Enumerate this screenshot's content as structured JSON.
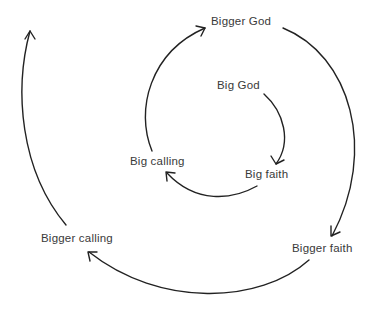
{
  "diagram": {
    "type": "spiral-cycle",
    "stroke_color": "#222222",
    "text_color": "#3a3a3a",
    "background": "#ffffff",
    "nodes": [
      {
        "id": "big-god",
        "label": "Big God"
      },
      {
        "id": "big-faith",
        "label": "Big faith"
      },
      {
        "id": "big-calling",
        "label": "Big calling"
      },
      {
        "id": "bigger-god",
        "label": "Bigger God"
      },
      {
        "id": "bigger-faith",
        "label": "Bigger faith"
      },
      {
        "id": "bigger-calling",
        "label": "Bigger calling"
      }
    ],
    "edges": [
      {
        "from": "Big God",
        "to": "Big faith"
      },
      {
        "from": "Big faith",
        "to": "Big calling"
      },
      {
        "from": "Big calling",
        "to": "Bigger God"
      },
      {
        "from": "Bigger God",
        "to": "Bigger faith"
      },
      {
        "from": "Bigger faith",
        "to": "Bigger calling"
      },
      {
        "from": "Bigger calling",
        "to": "(continues outward)"
      }
    ]
  }
}
